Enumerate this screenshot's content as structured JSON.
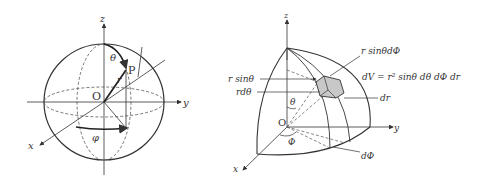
{
  "left_figure": {
    "axes": {
      "z": "z",
      "y": "y",
      "x": "x"
    },
    "origin": "O",
    "point": "P",
    "radius": "r",
    "polar_angle": "θ",
    "azimuth_angle": "φ"
  },
  "right_figure": {
    "axes": {
      "z": "z",
      "y": "y",
      "x": "x"
    },
    "origin": "O",
    "polar_angle": "θ",
    "azimuth_angle": "Φ",
    "labels": {
      "r_sin_theta_dphi": "r sinθdΦ",
      "volume_element": "dV = r² sinθ  dθ  dΦ dr",
      "r_sin_theta": "r sinθ",
      "r_dtheta": "rdθ",
      "dr": "dr",
      "dphi": "dΦ"
    }
  },
  "colors": {
    "line": "#333333",
    "dashed": "#555555",
    "volume_fill": "#c8c8c8",
    "background": "#ffffff"
  }
}
